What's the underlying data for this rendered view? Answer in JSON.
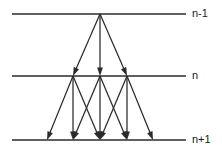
{
  "figure": {
    "width": 222,
    "height": 151,
    "background_color": "#ffffff",
    "line_color": "#2b2b2b",
    "text_color": "#1a1a1a"
  },
  "levels": [
    {
      "id": "level-n-minus-1",
      "label": "n-1",
      "y": 14,
      "x_start": 12,
      "x_end": 186,
      "label_x": 192,
      "label_y": 14,
      "nodes": [
        100
      ]
    },
    {
      "id": "level-n",
      "label": "n",
      "y": 76,
      "x_start": 12,
      "x_end": 186,
      "label_x": 192,
      "label_y": 76,
      "nodes": [
        73,
        100,
        127
      ]
    },
    {
      "id": "level-n-plus-1",
      "label": "n+1",
      "y": 140,
      "x_start": 12,
      "x_end": 186,
      "label_x": 192,
      "label_y": 140,
      "nodes": [
        47,
        73,
        100,
        127,
        153
      ]
    }
  ],
  "transitions": [
    {
      "id": "t1",
      "from_level": "level-n-minus-1",
      "to_level": "level-n",
      "x1": 100,
      "y1": 14,
      "x2": 73,
      "y2": 76
    },
    {
      "id": "t2",
      "from_level": "level-n-minus-1",
      "to_level": "level-n",
      "x1": 100,
      "y1": 14,
      "x2": 100,
      "y2": 76
    },
    {
      "id": "t3",
      "from_level": "level-n-minus-1",
      "to_level": "level-n",
      "x1": 100,
      "y1": 14,
      "x2": 127,
      "y2": 76
    },
    {
      "id": "t4",
      "from_level": "level-n",
      "to_level": "level-n-plus-1",
      "x1": 73,
      "y1": 76,
      "x2": 47,
      "y2": 140
    },
    {
      "id": "t5",
      "from_level": "level-n",
      "to_level": "level-n-plus-1",
      "x1": 73,
      "y1": 76,
      "x2": 73,
      "y2": 140
    },
    {
      "id": "t6",
      "from_level": "level-n",
      "to_level": "level-n-plus-1",
      "x1": 73,
      "y1": 76,
      "x2": 100,
      "y2": 140
    },
    {
      "id": "t7",
      "from_level": "level-n",
      "to_level": "level-n-plus-1",
      "x1": 100,
      "y1": 76,
      "x2": 73,
      "y2": 140
    },
    {
      "id": "t8",
      "from_level": "level-n",
      "to_level": "level-n-plus-1",
      "x1": 100,
      "y1": 76,
      "x2": 100,
      "y2": 140
    },
    {
      "id": "t9",
      "from_level": "level-n",
      "to_level": "level-n-plus-1",
      "x1": 100,
      "y1": 76,
      "x2": 127,
      "y2": 140
    },
    {
      "id": "t10",
      "from_level": "level-n",
      "to_level": "level-n-plus-1",
      "x1": 127,
      "y1": 76,
      "x2": 100,
      "y2": 140
    },
    {
      "id": "t11",
      "from_level": "level-n",
      "to_level": "level-n-plus-1",
      "x1": 127,
      "y1": 76,
      "x2": 127,
      "y2": 140
    },
    {
      "id": "t12",
      "from_level": "level-n",
      "to_level": "level-n-plus-1",
      "x1": 127,
      "y1": 76,
      "x2": 153,
      "y2": 140
    }
  ]
}
